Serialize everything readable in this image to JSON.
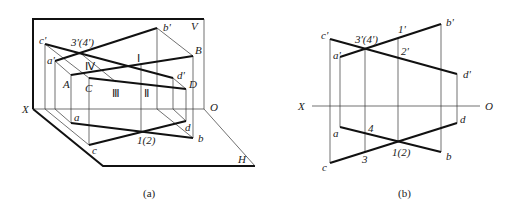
{
  "figure_a": {
    "caption": "(a)",
    "planes": {
      "V": "V",
      "H": "H"
    },
    "axis": {
      "X": "X",
      "O": "O"
    },
    "space_points": {
      "A": "A",
      "B": "B",
      "C": "C",
      "D": "D"
    },
    "v_projections": {
      "a": "a'",
      "b": "b'",
      "c": "c'",
      "d": "d'"
    },
    "h_projections": {
      "a": "a",
      "b": "b",
      "c": "c",
      "d": "d"
    },
    "roman_points": {
      "I": "Ⅰ",
      "II": "Ⅱ",
      "III": "Ⅲ",
      "IV": "Ⅳ"
    },
    "v_cross": "3'(4')",
    "h_cross": "1(2)"
  },
  "figure_b": {
    "caption": "(b)",
    "axis": {
      "X": "X",
      "O": "O"
    },
    "v_projections": {
      "a": "a'",
      "b": "b'",
      "c": "c'",
      "d": "d'"
    },
    "h_projections": {
      "a": "a",
      "b": "b",
      "c": "c",
      "d": "d"
    },
    "v_cross": "3'(4')",
    "v_point_1": "1'",
    "v_point_2": "2'",
    "h_point_4": "4",
    "h_point_3": "3",
    "h_cross": "1(2)"
  }
}
